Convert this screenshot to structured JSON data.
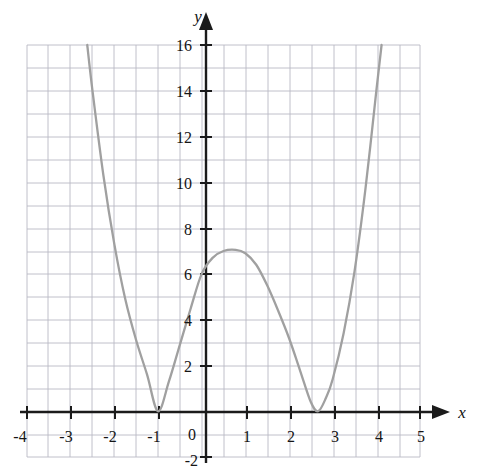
{
  "figure": {
    "title": "",
    "background_color": "#ffffff",
    "curve_color": "#a0a0a0",
    "axis_color": "#1b1b1b",
    "grid_color": "#b9b9c4"
  },
  "axes": {
    "x_label": "x",
    "y_label": "y",
    "x_label_style": "italic",
    "y_label_style": "italic",
    "x_ticks": [
      "-4",
      "-3",
      "-2",
      "-1",
      "1",
      "2",
      "3",
      "4",
      "5"
    ],
    "y_ticks": [
      "16",
      "14",
      "12",
      "10",
      "8",
      "6",
      "4",
      "2",
      "-2"
    ],
    "origin_label": "0",
    "x_arrow": true,
    "y_arrow": true
  },
  "chart_data": {
    "type": "line",
    "title": "",
    "xlabel": "x",
    "ylabel": "y",
    "xlim": [
      -4,
      5
    ],
    "ylim": [
      -2,
      16
    ],
    "xticks": [
      -4,
      -3,
      -2,
      -1,
      0,
      1,
      2,
      3,
      4,
      5
    ],
    "yticks": [
      -2,
      0,
      2,
      4,
      6,
      8,
      10,
      12,
      14,
      16
    ],
    "grid": true,
    "grid_minor_x_step": 0.5,
    "grid_major_x_step": 1,
    "grid_y_step": 1,
    "legend": "none",
    "series": [
      {
        "name": "quartic",
        "description": "Quartic polynomial with double roots (tangent to x-axis) at x = -1 and x = 2.67, y-intercept 6, local maximum 7 near x = 0.78",
        "roots": [
          -1,
          2.67
        ],
        "root_multiplicity": 2,
        "y_intercept": 6,
        "local_maximum": {
          "x": 0.78,
          "y": 7
        },
        "local_minima": [
          {
            "x": -1,
            "y": 0
          },
          {
            "x": 2.67,
            "y": 0
          }
        ],
        "x": [
          -2.62,
          -2.5,
          -2.25,
          -2.0,
          -1.75,
          -1.5,
          -1.25,
          -1.0,
          -0.75,
          -0.5,
          -0.25,
          0.0,
          0.25,
          0.5,
          0.78,
          1.0,
          1.25,
          1.5,
          1.75,
          2.0,
          2.25,
          2.5,
          2.67,
          2.85,
          3.0,
          3.25,
          3.5,
          3.75,
          4.0,
          4.12
        ],
        "y": [
          16.0,
          14.0,
          10.3,
          7.3,
          4.9,
          3.1,
          1.6,
          0.0,
          1.3,
          2.9,
          4.5,
          6.0,
          6.7,
          7.0,
          7.05,
          6.9,
          6.4,
          5.5,
          4.4,
          3.2,
          1.8,
          0.4,
          0.0,
          0.6,
          1.4,
          3.4,
          6.1,
          9.7,
          14.0,
          16.0
        ]
      }
    ]
  }
}
